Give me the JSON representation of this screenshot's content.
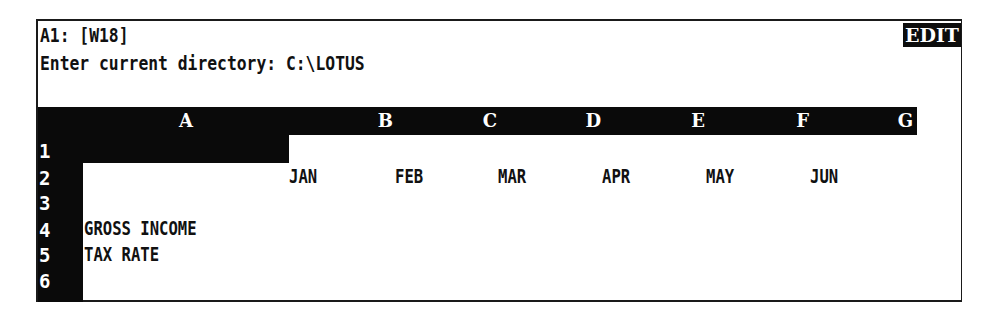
{
  "control_panel": {
    "cell_status": "A1: [W18]",
    "prompt": "Enter current directory: C:\\LOTUS",
    "mode_indicator": "EDIT"
  },
  "columns": [
    {
      "letter": "A",
      "left": 45,
      "width": 206
    },
    {
      "letter": "B",
      "left": 251,
      "width": 104
    },
    {
      "letter": "C",
      "left": 355,
      "width": 104
    },
    {
      "letter": "D",
      "left": 459,
      "width": 104
    },
    {
      "letter": "E",
      "left": 563,
      "width": 104
    },
    {
      "letter": "F",
      "left": 667,
      "width": 104
    },
    {
      "letter": "G",
      "left": 771,
      "width": 104
    }
  ],
  "rows": [
    "1",
    "2",
    "3",
    "4",
    "5",
    "6"
  ],
  "cell_pointer": "A1",
  "cells": {
    "B2": "JAN",
    "C2": "FEB",
    "D2": "MAR",
    "E2": "APR",
    "F2": "MAY",
    "G2": "JUN",
    "A4": "GROSS INCOME",
    "A5": "TAX RATE"
  },
  "colors": {
    "background": "#ffffff",
    "inverse": "#0a0a0a",
    "text": "#111111"
  }
}
